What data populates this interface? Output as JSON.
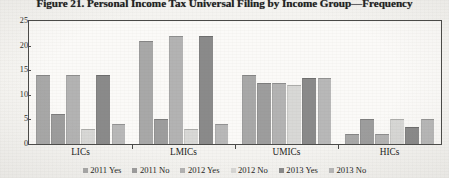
{
  "figure": {
    "title": "Figure 21. Personal Income Tax Universal Filing by Income Group—Frequency"
  },
  "chart_data": {
    "type": "bar",
    "title": "Figure 21. Personal Income Tax Universal Filing by Income Group—Frequency",
    "xlabel": "",
    "ylabel": "",
    "ylim": [
      0,
      25
    ],
    "yticks": [
      0,
      5,
      10,
      15,
      20,
      25
    ],
    "ytick_labels": [
      "0",
      "5",
      "10",
      "15",
      "20",
      "25"
    ],
    "grid": false,
    "legend_position": "bottom",
    "categories": [
      "LICs",
      "LMICs",
      "UMICs",
      "HICs"
    ],
    "series": [
      {
        "name": "2011 Yes",
        "color": "#a8a8a8",
        "values": [
          14,
          21,
          14,
          2
        ]
      },
      {
        "name": "2011 No",
        "color": "#9d9d9d",
        "values": [
          6,
          5,
          12.5,
          5
        ]
      },
      {
        "name": "2012 Yes",
        "color": "#b3b3b3",
        "values": [
          14,
          22,
          12.5,
          2
        ]
      },
      {
        "name": "2012 No",
        "color": "#d8d8d6",
        "values": [
          3,
          3,
          12,
          5
        ]
      },
      {
        "name": "2013 Yes",
        "color": "#8a8a8a",
        "values": [
          14,
          22,
          13.5,
          3.5
        ]
      },
      {
        "name": "2013 No",
        "color": "#b8b8b8",
        "values": [
          4,
          4,
          13.5,
          5
        ]
      }
    ]
  },
  "legend": {
    "items": [
      {
        "label": "2011 Yes",
        "color": "#a8a8a8"
      },
      {
        "label": "2011 No",
        "color": "#9d9d9d"
      },
      {
        "label": "2012 Yes",
        "color": "#b3b3b3"
      },
      {
        "label": "2012 No",
        "color": "#d8d8d6"
      },
      {
        "label": "2013 Yes",
        "color": "#8a8a8a"
      },
      {
        "label": "2013 No",
        "color": "#b8b8b8"
      }
    ]
  }
}
